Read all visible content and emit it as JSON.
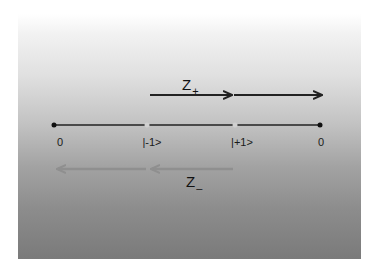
{
  "diagram": {
    "colors": {
      "axis": "#222222",
      "raise_arrow": "#222222",
      "lower_arrow": "#8f8f8f",
      "end_dot": "#111111",
      "state_dot": "#d0d0d0"
    },
    "axis_labels": [
      "0",
      "|-1>",
      "|+1>",
      "0"
    ],
    "raise_operator": {
      "symbol": "Z",
      "subscript": "+"
    },
    "lower_operator": {
      "symbol": "Z",
      "subscript": "–"
    }
  }
}
